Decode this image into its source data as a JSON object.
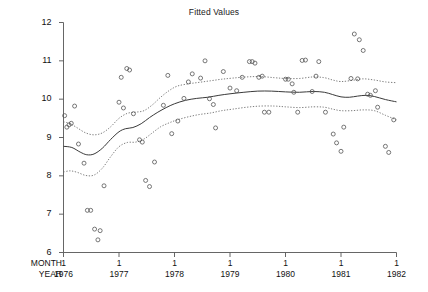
{
  "chart_data": {
    "type": "scatter",
    "title": "Fitted Values",
    "xlabel": "",
    "ylabel": "",
    "grid": false,
    "legend": "none",
    "axis_row_labels": {
      "month": "MONTH",
      "year": "YEAR"
    },
    "ylim": [
      6,
      12
    ],
    "yticks": [
      6,
      7,
      8,
      9,
      10,
      11,
      12
    ],
    "ytick_labels": [
      "6",
      "7",
      "8",
      "9",
      "10",
      "11",
      "12"
    ],
    "xlim": [
      1976.0,
      1982.0
    ],
    "xticks": [
      1976,
      1977,
      1978,
      1979,
      1980,
      1981,
      1982
    ],
    "xtick_month_labels": [
      "1",
      "1",
      "1",
      "1",
      "1",
      "1",
      "1"
    ],
    "xtick_year_labels": [
      "1976",
      "1977",
      "1978",
      "1979",
      "1980",
      "1981",
      "1982"
    ],
    "series": [
      {
        "name": "observations",
        "type": "scatter",
        "marker": "open-circle",
        "color": "#555555",
        "points": [
          [
            1976.02,
            9.57
          ],
          [
            1976.06,
            9.27
          ],
          [
            1976.1,
            9.33
          ],
          [
            1976.14,
            9.37
          ],
          [
            1976.2,
            9.82
          ],
          [
            1976.27,
            8.83
          ],
          [
            1976.37,
            8.33
          ],
          [
            1976.43,
            7.1
          ],
          [
            1976.49,
            7.1
          ],
          [
            1976.56,
            6.61
          ],
          [
            1976.62,
            6.33
          ],
          [
            1976.66,
            6.57
          ],
          [
            1976.73,
            7.74
          ],
          [
            1977.0,
            9.92
          ],
          [
            1977.04,
            10.57
          ],
          [
            1977.08,
            9.77
          ],
          [
            1977.14,
            10.8
          ],
          [
            1977.19,
            10.76
          ],
          [
            1977.26,
            9.62
          ],
          [
            1977.37,
            8.94
          ],
          [
            1977.42,
            8.88
          ],
          [
            1977.48,
            7.88
          ],
          [
            1977.55,
            7.72
          ],
          [
            1977.64,
            8.36
          ],
          [
            1977.8,
            9.84
          ],
          [
            1977.88,
            10.62
          ],
          [
            1977.95,
            9.1
          ],
          [
            1978.06,
            9.43
          ],
          [
            1978.17,
            10.02
          ],
          [
            1978.25,
            10.45
          ],
          [
            1978.32,
            10.66
          ],
          [
            1978.47,
            10.55
          ],
          [
            1978.55,
            11.0
          ],
          [
            1978.63,
            10.01
          ],
          [
            1978.7,
            9.86
          ],
          [
            1978.74,
            9.25
          ],
          [
            1978.88,
            10.72
          ],
          [
            1979.0,
            10.29
          ],
          [
            1979.12,
            10.22
          ],
          [
            1979.22,
            10.57
          ],
          [
            1979.35,
            10.98
          ],
          [
            1979.4,
            10.98
          ],
          [
            1979.45,
            10.94
          ],
          [
            1979.52,
            10.57
          ],
          [
            1979.58,
            10.6
          ],
          [
            1979.62,
            9.66
          ],
          [
            1979.7,
            9.66
          ],
          [
            1980.0,
            10.52
          ],
          [
            1980.05,
            10.52
          ],
          [
            1980.12,
            10.4
          ],
          [
            1980.15,
            10.18
          ],
          [
            1980.22,
            9.66
          ],
          [
            1980.3,
            11.01
          ],
          [
            1980.36,
            11.02
          ],
          [
            1980.48,
            10.2
          ],
          [
            1980.55,
            10.6
          ],
          [
            1980.6,
            10.98
          ],
          [
            1980.72,
            9.66
          ],
          [
            1980.86,
            9.09
          ],
          [
            1980.92,
            8.86
          ],
          [
            1981.0,
            8.64
          ],
          [
            1981.05,
            9.27
          ],
          [
            1981.18,
            10.54
          ],
          [
            1981.24,
            11.7
          ],
          [
            1981.3,
            10.53
          ],
          [
            1981.33,
            11.55
          ],
          [
            1981.4,
            11.27
          ],
          [
            1981.48,
            10.13
          ],
          [
            1981.53,
            10.1
          ],
          [
            1981.62,
            10.22
          ],
          [
            1981.66,
            9.79
          ],
          [
            1981.8,
            8.77
          ],
          [
            1981.86,
            8.61
          ],
          [
            1981.95,
            9.46
          ]
        ]
      },
      {
        "name": "fitted-center",
        "type": "line",
        "style": "solid",
        "color": "#3a3a3a",
        "points": [
          [
            1976.0,
            8.77
          ],
          [
            1976.15,
            8.74
          ],
          [
            1976.3,
            8.62
          ],
          [
            1976.42,
            8.55
          ],
          [
            1976.55,
            8.57
          ],
          [
            1976.7,
            8.72
          ],
          [
            1976.85,
            8.95
          ],
          [
            1977.0,
            9.15
          ],
          [
            1977.12,
            9.23
          ],
          [
            1977.25,
            9.26
          ],
          [
            1977.4,
            9.36
          ],
          [
            1977.55,
            9.52
          ],
          [
            1977.7,
            9.66
          ],
          [
            1977.85,
            9.78
          ],
          [
            1978.0,
            9.88
          ],
          [
            1978.2,
            9.97
          ],
          [
            1978.4,
            10.02
          ],
          [
            1978.6,
            10.05
          ],
          [
            1978.8,
            10.1
          ],
          [
            1979.0,
            10.14
          ],
          [
            1979.25,
            10.18
          ],
          [
            1979.5,
            10.21
          ],
          [
            1979.75,
            10.21
          ],
          [
            1980.0,
            10.19
          ],
          [
            1980.25,
            10.18
          ],
          [
            1980.5,
            10.2
          ],
          [
            1980.7,
            10.18
          ],
          [
            1980.85,
            10.12
          ],
          [
            1981.0,
            10.06
          ],
          [
            1981.15,
            10.05
          ],
          [
            1981.3,
            10.08
          ],
          [
            1981.45,
            10.1
          ],
          [
            1981.6,
            10.07
          ],
          [
            1981.8,
            9.99
          ],
          [
            1982.0,
            9.93
          ]
        ]
      },
      {
        "name": "upper-band",
        "type": "line",
        "style": "dotted",
        "color": "#666666",
        "points": [
          [
            1976.0,
            9.41
          ],
          [
            1976.12,
            9.36
          ],
          [
            1976.25,
            9.25
          ],
          [
            1976.4,
            9.12
          ],
          [
            1976.55,
            9.07
          ],
          [
            1976.7,
            9.12
          ],
          [
            1976.85,
            9.28
          ],
          [
            1977.0,
            9.5
          ],
          [
            1977.15,
            9.63
          ],
          [
            1977.3,
            9.66
          ],
          [
            1977.45,
            9.7
          ],
          [
            1977.6,
            9.85
          ],
          [
            1977.75,
            10.05
          ],
          [
            1977.9,
            10.22
          ],
          [
            1978.05,
            10.34
          ],
          [
            1978.25,
            10.4
          ],
          [
            1978.45,
            10.44
          ],
          [
            1978.65,
            10.48
          ],
          [
            1978.85,
            10.52
          ],
          [
            1979.05,
            10.55
          ],
          [
            1979.3,
            10.58
          ],
          [
            1979.55,
            10.59
          ],
          [
            1979.8,
            10.56
          ],
          [
            1980.0,
            10.54
          ],
          [
            1980.25,
            10.54
          ],
          [
            1980.5,
            10.58
          ],
          [
            1980.7,
            10.56
          ],
          [
            1980.85,
            10.5
          ],
          [
            1981.0,
            10.46
          ],
          [
            1981.2,
            10.49
          ],
          [
            1981.4,
            10.53
          ],
          [
            1981.6,
            10.5
          ],
          [
            1981.8,
            10.45
          ],
          [
            1982.0,
            10.43
          ]
        ]
      },
      {
        "name": "lower-band",
        "type": "line",
        "style": "dotted",
        "color": "#666666",
        "points": [
          [
            1976.0,
            8.1
          ],
          [
            1976.12,
            8.13
          ],
          [
            1976.25,
            8.09
          ],
          [
            1976.4,
            8.01
          ],
          [
            1976.55,
            8.02
          ],
          [
            1976.7,
            8.2
          ],
          [
            1976.85,
            8.5
          ],
          [
            1977.0,
            8.76
          ],
          [
            1977.15,
            8.87
          ],
          [
            1977.3,
            8.88
          ],
          [
            1977.45,
            8.96
          ],
          [
            1977.6,
            9.12
          ],
          [
            1977.75,
            9.28
          ],
          [
            1977.9,
            9.38
          ],
          [
            1978.05,
            9.46
          ],
          [
            1978.25,
            9.54
          ],
          [
            1978.45,
            9.6
          ],
          [
            1978.65,
            9.64
          ],
          [
            1978.85,
            9.7
          ],
          [
            1979.05,
            9.74
          ],
          [
            1979.3,
            9.79
          ],
          [
            1979.55,
            9.82
          ],
          [
            1979.8,
            9.82
          ],
          [
            1980.0,
            9.8
          ],
          [
            1980.25,
            9.78
          ],
          [
            1980.5,
            9.8
          ],
          [
            1980.7,
            9.79
          ],
          [
            1980.85,
            9.74
          ],
          [
            1981.0,
            9.7
          ],
          [
            1981.2,
            9.7
          ],
          [
            1981.4,
            9.72
          ],
          [
            1981.6,
            9.7
          ],
          [
            1981.8,
            9.58
          ],
          [
            1982.0,
            9.46
          ]
        ]
      }
    ]
  }
}
